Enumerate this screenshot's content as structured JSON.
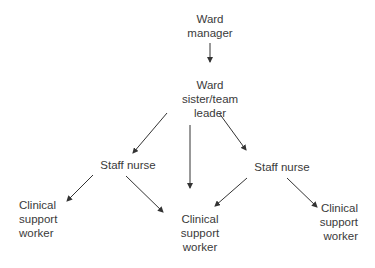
{
  "diagram": {
    "type": "hierarchy",
    "nodes": {
      "ward_manager": {
        "lines": [
          "Ward",
          "manager"
        ]
      },
      "ward_sister": {
        "lines": [
          "Ward",
          "sister/team",
          "leader"
        ]
      },
      "staff_nurse_left": {
        "lines": [
          "Staff nurse"
        ]
      },
      "staff_nurse_right": {
        "lines": [
          "Staff nurse"
        ]
      },
      "csw_left": {
        "lines": [
          "Clinical",
          "support",
          "worker"
        ]
      },
      "csw_middle": {
        "lines": [
          "Clinical",
          "support",
          "worker"
        ]
      },
      "csw_right": {
        "lines": [
          "Clinical",
          "support",
          "worker"
        ]
      }
    },
    "edges": [
      {
        "from": "ward_manager",
        "to": "ward_sister"
      },
      {
        "from": "ward_sister",
        "to": "staff_nurse_left"
      },
      {
        "from": "ward_sister",
        "to": "csw_middle"
      },
      {
        "from": "ward_sister",
        "to": "staff_nurse_right"
      },
      {
        "from": "staff_nurse_left",
        "to": "csw_left"
      },
      {
        "from": "staff_nurse_left",
        "to": "csw_middle"
      },
      {
        "from": "staff_nurse_right",
        "to": "csw_middle"
      },
      {
        "from": "staff_nurse_right",
        "to": "csw_right"
      }
    ],
    "colors": {
      "text": "#3a3a3a",
      "arrow": "#333333",
      "background": "#ffffff"
    }
  }
}
